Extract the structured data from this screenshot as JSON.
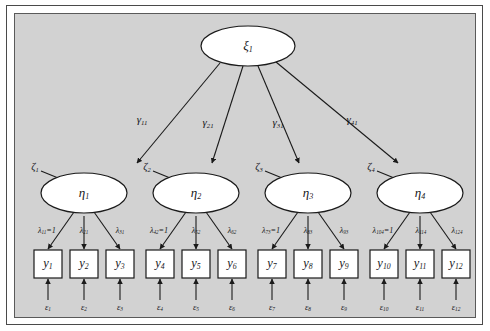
{
  "diagram": {
    "type": "sem-path-diagram",
    "background_color": "#d2d2d2",
    "frame_color": "#4a4a4a",
    "node_fill": "#ffffff",
    "line_color": "#1a1a1a",
    "exogenous_latent": {
      "id": "xi1",
      "label": "ξ",
      "subscript": "1",
      "shape": "ellipse"
    },
    "structural_paths": [
      {
        "id": "gamma11",
        "label": "γ",
        "subscript": "11",
        "from": "xi1",
        "to": "eta1"
      },
      {
        "id": "gamma21",
        "label": "γ",
        "subscript": "21",
        "from": "xi1",
        "to": "eta2"
      },
      {
        "id": "gamma31",
        "label": "γ",
        "subscript": "31",
        "from": "xi1",
        "to": "eta3"
      },
      {
        "id": "gamma41",
        "label": "γ",
        "subscript": "41",
        "from": "xi1",
        "to": "eta4"
      }
    ],
    "endogenous_latents": [
      {
        "id": "eta1",
        "label": "η",
        "subscript": "1",
        "shape": "ellipse"
      },
      {
        "id": "eta2",
        "label": "η",
        "subscript": "2",
        "shape": "ellipse"
      },
      {
        "id": "eta3",
        "label": "η",
        "subscript": "3",
        "shape": "ellipse"
      },
      {
        "id": "eta4",
        "label": "η",
        "subscript": "4",
        "shape": "ellipse"
      }
    ],
    "disturbances": [
      {
        "id": "zeta1",
        "label": "ζ",
        "subscript": "1",
        "to": "eta1"
      },
      {
        "id": "zeta2",
        "label": "ζ",
        "subscript": "2",
        "to": "eta2"
      },
      {
        "id": "zeta3",
        "label": "ζ",
        "subscript": "3",
        "to": "eta3"
      },
      {
        "id": "zeta4",
        "label": "ζ",
        "subscript": "4",
        "to": "eta4"
      }
    ],
    "loadings": [
      {
        "id": "lambda11",
        "label": "λ",
        "subscript": "11",
        "fixed": "=1",
        "text": "λ₁₁=1",
        "from": "eta1",
        "to": "y1"
      },
      {
        "id": "lambda21",
        "label": "λ",
        "subscript": "21",
        "fixed": "",
        "text": "λ₂₁",
        "from": "eta1",
        "to": "y2"
      },
      {
        "id": "lambda31",
        "label": "λ",
        "subscript": "31",
        "fixed": "",
        "text": "λ₃₁",
        "from": "eta1",
        "to": "y3"
      },
      {
        "id": "lambda42",
        "label": "λ",
        "subscript": "42",
        "fixed": "=1",
        "text": "λ₄₂=1",
        "from": "eta2",
        "to": "y4"
      },
      {
        "id": "lambda52",
        "label": "λ",
        "subscript": "52",
        "fixed": "",
        "text": "λ₅₂",
        "from": "eta2",
        "to": "y5"
      },
      {
        "id": "lambda62",
        "label": "λ",
        "subscript": "62",
        "fixed": "",
        "text": "λ₆₂",
        "from": "eta2",
        "to": "y6"
      },
      {
        "id": "lambda73",
        "label": "λ",
        "subscript": "73",
        "fixed": "=1",
        "text": "λ₇₃=1",
        "from": "eta3",
        "to": "y7"
      },
      {
        "id": "lambda83",
        "label": "λ",
        "subscript": "83",
        "fixed": "",
        "text": "λ₈₃",
        "from": "eta3",
        "to": "y8"
      },
      {
        "id": "lambda93",
        "label": "λ",
        "subscript": "93",
        "fixed": "",
        "text": "λ₉₃",
        "from": "eta3",
        "to": "y9"
      },
      {
        "id": "lambda104",
        "label": "λ",
        "subscript": "104",
        "fixed": "=1",
        "text": "λ₁₀₄=1",
        "from": "eta4",
        "to": "y10"
      },
      {
        "id": "lambda114",
        "label": "λ",
        "subscript": "114",
        "fixed": "",
        "text": "λ₁₁₄",
        "from": "eta4",
        "to": "y11"
      },
      {
        "id": "lambda124",
        "label": "λ",
        "subscript": "124",
        "fixed": "",
        "text": "λ₁₂₄",
        "from": "eta4",
        "to": "y12"
      }
    ],
    "indicators": [
      {
        "id": "y1",
        "label": "y",
        "subscript": "1"
      },
      {
        "id": "y2",
        "label": "y",
        "subscript": "2"
      },
      {
        "id": "y3",
        "label": "y",
        "subscript": "3"
      },
      {
        "id": "y4",
        "label": "y",
        "subscript": "4"
      },
      {
        "id": "y5",
        "label": "y",
        "subscript": "5"
      },
      {
        "id": "y6",
        "label": "y",
        "subscript": "6"
      },
      {
        "id": "y7",
        "label": "y",
        "subscript": "7"
      },
      {
        "id": "y8",
        "label": "y",
        "subscript": "8"
      },
      {
        "id": "y9",
        "label": "y",
        "subscript": "9"
      },
      {
        "id": "y10",
        "label": "y",
        "subscript": "10"
      },
      {
        "id": "y11",
        "label": "y",
        "subscript": "11"
      },
      {
        "id": "y12",
        "label": "y",
        "subscript": "12"
      }
    ],
    "measurement_errors": [
      {
        "id": "eps1",
        "label": "ε",
        "subscript": "1",
        "to": "y1"
      },
      {
        "id": "eps2",
        "label": "ε",
        "subscript": "2",
        "to": "y2"
      },
      {
        "id": "eps3",
        "label": "ε",
        "subscript": "3",
        "to": "y3"
      },
      {
        "id": "eps4",
        "label": "ε",
        "subscript": "4",
        "to": "y4"
      },
      {
        "id": "eps5",
        "label": "ε",
        "subscript": "5",
        "to": "y5"
      },
      {
        "id": "eps6",
        "label": "ε",
        "subscript": "6",
        "to": "y6"
      },
      {
        "id": "eps7",
        "label": "ε",
        "subscript": "7",
        "to": "y7"
      },
      {
        "id": "eps8",
        "label": "ε",
        "subscript": "8",
        "to": "y8"
      },
      {
        "id": "eps9",
        "label": "ε",
        "subscript": "9",
        "to": "y9"
      },
      {
        "id": "eps10",
        "label": "ε",
        "subscript": "10",
        "to": "y10"
      },
      {
        "id": "eps11",
        "label": "ε",
        "subscript": "11",
        "to": "y11"
      },
      {
        "id": "eps12",
        "label": "ε",
        "subscript": "12",
        "to": "y12"
      }
    ]
  }
}
